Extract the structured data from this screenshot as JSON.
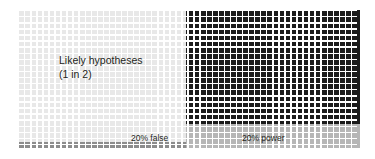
{
  "figure": {
    "type": "conceptual-grid-diagram",
    "width": 375,
    "height": 159,
    "background": "#ffffff"
  },
  "labels": {
    "likely_line1": "Likely hypotheses",
    "likely_line2": "(1 in 2)",
    "false_positive": "20% false",
    "power": "20% power"
  },
  "colors": {
    "background": "#ffffff",
    "gridline": "#ffffff",
    "light_cells": "#e8e8e8",
    "dark_cells": "#1b1b1b",
    "mid_gray_cells": "#b6b6b6",
    "false_positive_cells": "#8c8c8c",
    "text": "#231f20"
  },
  "chart_data": {
    "type": "heatmap",
    "title": "Likely hypotheses (1 in 2)",
    "xlabel": "",
    "ylabel": "",
    "grid": {
      "columns": 57,
      "rows": 23,
      "cell_size_px": 6,
      "gridline_color": "#ffffff",
      "origin_px": [
        18,
        10
      ],
      "extent_px": [
        339,
        140
      ]
    },
    "legend_position": "inline-bottom",
    "regions": [
      {
        "name": "likely-hypotheses-true-negatives",
        "label": "Likely hypotheses (1 in 2)",
        "color": "#e8e8e8",
        "columns": [
          0,
          27
        ],
        "rows": [
          0,
          21
        ],
        "share_percent": 50,
        "description": "Left half of the grid: null hypotheses that are true; 1 in 2 hypotheses"
      },
      {
        "name": "false-positives",
        "label": "20% false",
        "color": "#8c8c8c",
        "columns": [
          0,
          27
        ],
        "rows": [
          22,
          22
        ],
        "share_percent": 20,
        "description": "Bottom row of the left half shaded mid-gray, representing the 20% false positive rate"
      },
      {
        "name": "true-positives-power",
        "label": "20% power",
        "color": "#1b1b1b",
        "columns": [
          28,
          56
        ],
        "rows": [
          0,
          18
        ],
        "share_percent": 80,
        "description": "Dark block on the right: the portion of real effects not detected"
      },
      {
        "name": "detected-effects",
        "label": "20% power",
        "color": "#b6b6b6",
        "columns": [
          28,
          56
        ],
        "rows": [
          19,
          22
        ],
        "share_percent": 20,
        "description": "Lighter gray band at bottom right, representing the 20% statistical power"
      }
    ],
    "annotations": [
      {
        "text": "Likely hypotheses",
        "x_px": 59,
        "y_px": 54
      },
      {
        "text": "(1 in 2)",
        "x_px": 59,
        "y_px": 67
      },
      {
        "text": "20% false",
        "x_px": 131,
        "y_px": 133
      },
      {
        "text": "20% power",
        "x_px": 242,
        "y_px": 133
      }
    ]
  }
}
